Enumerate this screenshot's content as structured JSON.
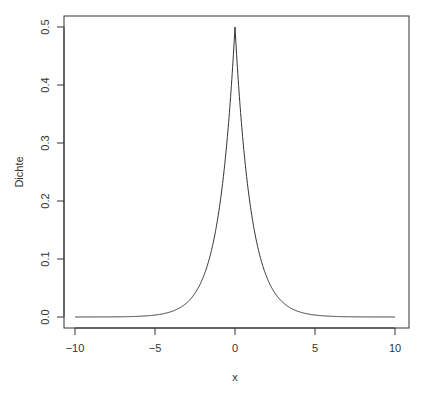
{
  "chart_data": {
    "type": "line",
    "title": "",
    "xlabel": "x",
    "ylabel": "Dichte",
    "xlim": [
      -10,
      10
    ],
    "ylim": [
      0,
      0.5
    ],
    "grid": false,
    "legend": null,
    "x_ticks": [
      "-10",
      "-5",
      "0",
      "5",
      "10"
    ],
    "y_ticks": [
      "0.0",
      "0.1",
      "0.2",
      "0.3",
      "0.4",
      "0.5"
    ],
    "series": [
      {
        "name": "Laplace density 0.5*exp(-|x|)",
        "color": "#333333",
        "x": [
          -10,
          -8,
          -6,
          -5,
          -4,
          -3,
          -2.5,
          -2,
          -1.5,
          -1,
          -0.75,
          -0.5,
          -0.25,
          0,
          0.25,
          0.5,
          0.75,
          1,
          1.5,
          2,
          2.5,
          3,
          4,
          5,
          6,
          8,
          10
        ],
        "y": [
          0.0,
          0.0002,
          0.0012,
          0.0034,
          0.0092,
          0.0249,
          0.041,
          0.0677,
          0.1116,
          0.1839,
          0.2362,
          0.3033,
          0.3894,
          0.5,
          0.3894,
          0.3033,
          0.2362,
          0.1839,
          0.1116,
          0.0677,
          0.041,
          0.0249,
          0.0092,
          0.0034,
          0.0012,
          0.0002,
          0.0
        ]
      }
    ]
  }
}
